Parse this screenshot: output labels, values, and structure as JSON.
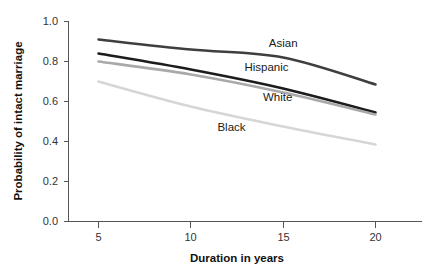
{
  "chart_data": {
    "type": "line",
    "title": "",
    "xlabel": "Duration in years",
    "ylabel": "Probability of intact marriage",
    "x": [
      5,
      10,
      15,
      20
    ],
    "xlim": [
      3.2,
      22.0
    ],
    "ylim": [
      0.0,
      1.0
    ],
    "grid": false,
    "legend_position": "inline-right-of-lines",
    "xticks": [
      5,
      10,
      15,
      20
    ],
    "xtick_labels": [
      "5",
      "10",
      "15",
      "20"
    ],
    "yticks": [
      0.0,
      0.2,
      0.4,
      0.6,
      0.8,
      1.0
    ],
    "ytick_labels": [
      "0.0",
      "0.2",
      "0.4",
      "0.6",
      "0.8",
      "1.0"
    ],
    "series": [
      {
        "name": "Asian",
        "values": [
          0.91,
          0.86,
          0.82,
          0.685
        ],
        "color": "#3f3f3f",
        "label_x": 15.0,
        "label_y": 0.875
      },
      {
        "name": "Hispanic",
        "values": [
          0.84,
          0.76,
          0.665,
          0.545
        ],
        "color": "#1c1c1c",
        "label_x": 14.1,
        "label_y": 0.755
      },
      {
        "name": "White",
        "values": [
          0.8,
          0.735,
          0.645,
          0.535
        ],
        "color": "#a9a9a9",
        "label_x": 14.7,
        "label_y": 0.605
      },
      {
        "name": "Black",
        "values": [
          0.7,
          0.575,
          0.475,
          0.385
        ],
        "color": "#d6d6d6",
        "label_x": 12.2,
        "label_y": 0.455
      }
    ]
  },
  "axes": {
    "x_title": "Duration in years",
    "y_title": "Probability of intact marriage"
  }
}
